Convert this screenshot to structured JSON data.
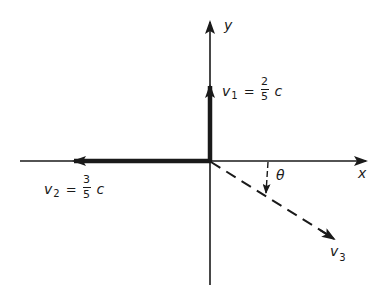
{
  "diagram": {
    "type": "velocity-vector-diagram",
    "colors": {
      "ink": "#1a1a1a",
      "background": "#ffffff"
    },
    "axes": {
      "x_label": "x",
      "y_label": "y"
    },
    "vectors": {
      "v1": {
        "symbol": "v",
        "subscript": "1",
        "equals": "=",
        "numerator": "2",
        "denominator": "5",
        "unit": "c",
        "direction": "+y",
        "style": "thick solid"
      },
      "v2": {
        "symbol": "v",
        "subscript": "2",
        "equals": "=",
        "numerator": "3",
        "denominator": "5",
        "unit": "c",
        "direction": "-x",
        "style": "thick solid"
      },
      "v3": {
        "symbol": "v",
        "subscript": "3",
        "direction": "below +x by angle theta",
        "style": "dashed"
      }
    },
    "angle": {
      "label": "θ"
    }
  }
}
